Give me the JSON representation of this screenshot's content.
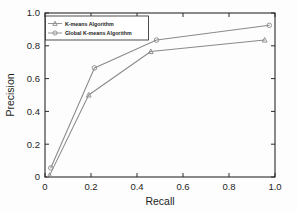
{
  "figure": {
    "background_color": "#fdfdfd"
  },
  "chart_data": {
    "type": "line",
    "title": "",
    "xlabel": "Recall",
    "ylabel": "Precision",
    "xlim": [
      0.0,
      1.0
    ],
    "ylim": [
      0.0,
      1.0
    ],
    "grid": false,
    "legend_position": "upper left",
    "xticks": [
      "0",
      "0.2",
      "0.4",
      "0.6",
      "0.8",
      "1.0"
    ],
    "xtick_values": [
      0.0,
      0.2,
      0.4,
      0.6,
      0.8,
      1.0
    ],
    "yticks": [
      "0",
      "0.2",
      "0.4",
      "0.6",
      "0.8",
      "1.0"
    ],
    "ytick_values": [
      0.0,
      0.2,
      0.4,
      0.6,
      0.8,
      1.0
    ],
    "series": [
      {
        "name": "K-means Algorithm",
        "marker": "triangle",
        "color": "#8a8a8a",
        "x": [
          0.02,
          0.19,
          0.46,
          0.955
        ],
        "y": [
          0.01,
          0.5,
          0.765,
          0.835
        ]
      },
      {
        "name": "Global K-means Algorithm",
        "marker": "circle",
        "color": "#8a8a8a",
        "x": [
          0.025,
          0.215,
          0.485,
          0.975
        ],
        "y": [
          0.055,
          0.665,
          0.835,
          0.925
        ]
      }
    ]
  },
  "legend": {
    "entries": [
      {
        "label": "K-means Algorithm",
        "marker": "triangle-marker"
      },
      {
        "label": "Global K-means Algorithm",
        "marker": "circle-marker"
      }
    ]
  }
}
